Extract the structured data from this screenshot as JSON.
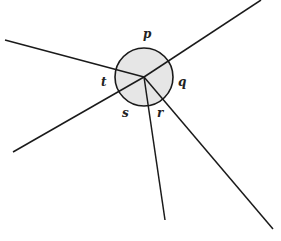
{
  "diagram": {
    "type": "geometry",
    "circle": {
      "cx": 144,
      "cy": 77,
      "r": 29,
      "fill": "#e6e6e6",
      "stroke": "#1a1a1a"
    },
    "center_point": {
      "x": 144,
      "y": 77
    },
    "rays": [
      {
        "id": "upper-right",
        "x2": 261,
        "y2": 0
      },
      {
        "id": "left",
        "x2": 5,
        "y2": 40
      },
      {
        "id": "lower-left",
        "x2": 13,
        "y2": 152
      },
      {
        "id": "down",
        "x2": 165,
        "y2": 220
      },
      {
        "id": "lower-right",
        "x2": 273,
        "y2": 229
      }
    ],
    "labels": [
      {
        "id": "p",
        "text": "p",
        "x": 143,
        "y": 38
      },
      {
        "id": "q",
        "text": "q",
        "x": 178,
        "y": 86
      },
      {
        "id": "r",
        "text": "r",
        "x": 157,
        "y": 117
      },
      {
        "id": "s",
        "text": "s",
        "x": 122,
        "y": 117
      },
      {
        "id": "t",
        "text": "t",
        "x": 101,
        "y": 86
      }
    ]
  }
}
